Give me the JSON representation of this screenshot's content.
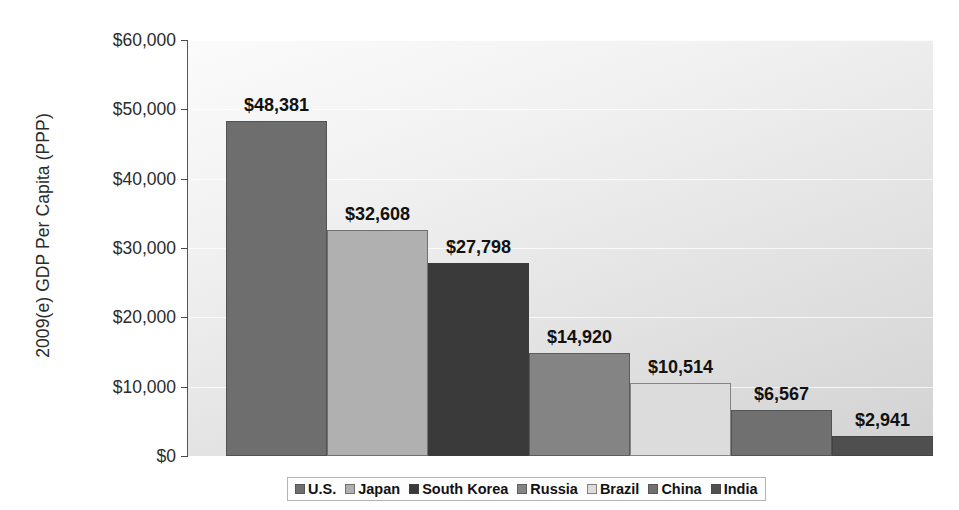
{
  "chart_data": {
    "type": "bar",
    "title": "",
    "subtitle": "",
    "xlabel": "",
    "ylabel": "2009(e) GDP Per Capita (PPP)",
    "categories": [
      "U.S.",
      "Japan",
      "South Korea",
      "Russia",
      "Brazil",
      "China",
      "India"
    ],
    "values": [
      48381,
      32608,
      27798,
      14920,
      10514,
      6567,
      2941
    ],
    "data_labels": [
      "$48,381",
      "$32,608",
      "$27,798",
      "$14,920",
      "$10,514",
      "$6,567",
      "$2,941"
    ],
    "ylim": [
      0,
      60000
    ],
    "ytick_values": [
      0,
      10000,
      20000,
      30000,
      40000,
      50000,
      60000
    ],
    "ytick_labels": [
      "$0",
      "$10,000",
      "$20,000",
      "$30,000",
      "$40,000",
      "$50,000",
      "$60,000"
    ],
    "grid": true,
    "legend_position": "bottom",
    "bar_colors": [
      "#6e6e6e",
      "#b0b0b0",
      "#3a3a3a",
      "#848484",
      "#dcdcdc",
      "#707070",
      "#4f4f4f"
    ],
    "legend": [
      {
        "label": "U.S.",
        "color": "#6e6e6e"
      },
      {
        "label": "Japan",
        "color": "#b0b0b0"
      },
      {
        "label": "South Korea",
        "color": "#3a3a3a"
      },
      {
        "label": "Russia",
        "color": "#848484"
      },
      {
        "label": "Brazil",
        "color": "#dcdcdc"
      },
      {
        "label": "China",
        "color": "#707070"
      },
      {
        "label": "India",
        "color": "#4f4f4f"
      }
    ]
  }
}
